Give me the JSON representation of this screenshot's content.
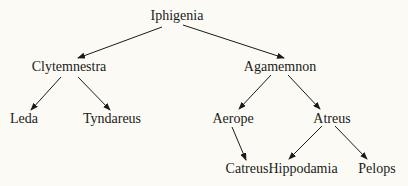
{
  "diagram": {
    "type": "family-tree",
    "background": "#fbfaf4",
    "nodes": [
      {
        "id": "iphigenia",
        "label": "Iphigenia",
        "x": 177,
        "y": 16
      },
      {
        "id": "clytemnestra",
        "label": "Clytemnestra",
        "x": 69,
        "y": 67
      },
      {
        "id": "agamemnon",
        "label": "Agamemnon",
        "x": 280,
        "y": 67
      },
      {
        "id": "leda",
        "label": "Leda",
        "x": 24,
        "y": 119
      },
      {
        "id": "tyndareus",
        "label": "Tyndareus",
        "x": 112,
        "y": 119
      },
      {
        "id": "aerope",
        "label": "Aerope",
        "x": 233,
        "y": 119
      },
      {
        "id": "atreus",
        "label": "Atreus",
        "x": 332,
        "y": 119
      },
      {
        "id": "catreus",
        "label": "Catreus",
        "x": 247,
        "y": 169
      },
      {
        "id": "hippodamia",
        "label": "Hippodamia",
        "x": 303,
        "y": 169
      },
      {
        "id": "pelops",
        "label": "Pelops",
        "x": 377,
        "y": 169
      }
    ],
    "edges": [
      {
        "from": "iphigenia",
        "to": "clytemnestra",
        "x1": 162,
        "y1": 27,
        "x2": 78,
        "y2": 58
      },
      {
        "from": "iphigenia",
        "to": "agamemnon",
        "x1": 183,
        "y1": 25,
        "x2": 284,
        "y2": 58
      },
      {
        "from": "clytemnestra",
        "to": "leda",
        "x1": 61,
        "y1": 77,
        "x2": 31,
        "y2": 110
      },
      {
        "from": "clytemnestra",
        "to": "tyndareus",
        "x1": 78,
        "y1": 77,
        "x2": 110,
        "y2": 110
      },
      {
        "from": "agamemnon",
        "to": "aerope",
        "x1": 271,
        "y1": 75,
        "x2": 239,
        "y2": 109
      },
      {
        "from": "agamemnon",
        "to": "atreus",
        "x1": 288,
        "y1": 75,
        "x2": 320,
        "y2": 109
      },
      {
        "from": "aerope",
        "to": "catreus",
        "x1": 232,
        "y1": 127,
        "x2": 246,
        "y2": 160
      },
      {
        "from": "atreus",
        "to": "hippodamia",
        "x1": 322,
        "y1": 126,
        "x2": 289,
        "y2": 159
      },
      {
        "from": "atreus",
        "to": "pelops",
        "x1": 335,
        "y1": 126,
        "x2": 367,
        "y2": 159
      }
    ]
  }
}
